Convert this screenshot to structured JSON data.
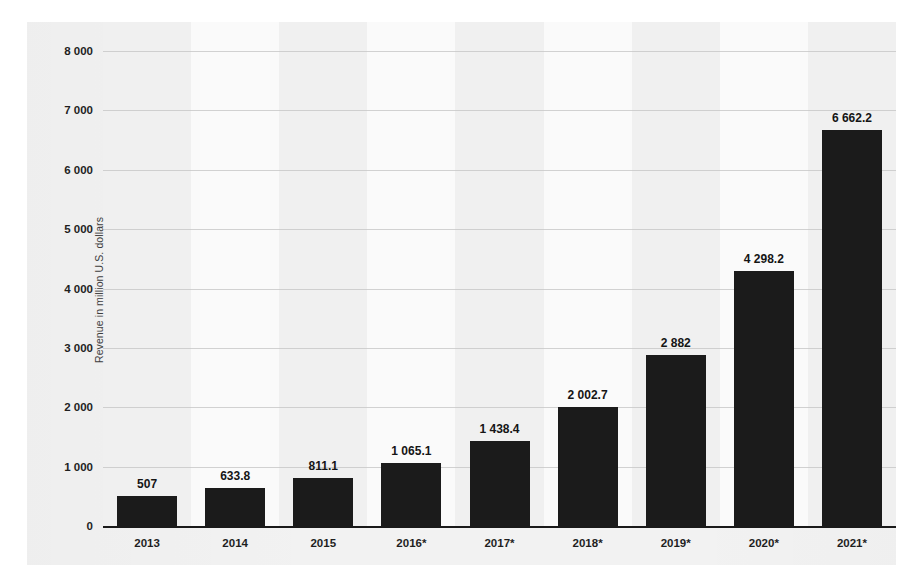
{
  "chart_data": {
    "type": "bar",
    "title": "",
    "xlabel": "",
    "ylabel": "Revenue in million U.S. dollars",
    "categories": [
      "2013",
      "2014",
      "2015",
      "2016*",
      "2017*",
      "2018*",
      "2019*",
      "2020*",
      "2021*"
    ],
    "values": [
      507,
      633.8,
      811.1,
      1065.1,
      1438.4,
      2002.7,
      2882,
      4298.2,
      6662.2
    ],
    "value_labels": [
      "507",
      "633.8",
      "811.1",
      "1 065.1",
      "1 438.4",
      "2 002.7",
      "2 882",
      "4 298.2",
      "6 662.2"
    ],
    "ylim": [
      0,
      8000
    ],
    "ytick_values": [
      0,
      1000,
      2000,
      3000,
      4000,
      5000,
      6000,
      7000,
      8000
    ],
    "ytick_labels": [
      "0",
      "1 000",
      "2 000",
      "3 000",
      "4 000",
      "5 000",
      "6 000",
      "7 000",
      "8 000"
    ],
    "grid": true,
    "grid_axis": "y",
    "legend": false,
    "legend_position": "none",
    "bar_color": "#1b1b1b",
    "gridline_color": "#c9c9c9",
    "panel_color": "#f2f2f2",
    "band_color_a": "#f0f0f0",
    "band_color_b": "#fafafa",
    "axis_color": "#1a1a1a",
    "text_color": "#1f1f1f"
  }
}
